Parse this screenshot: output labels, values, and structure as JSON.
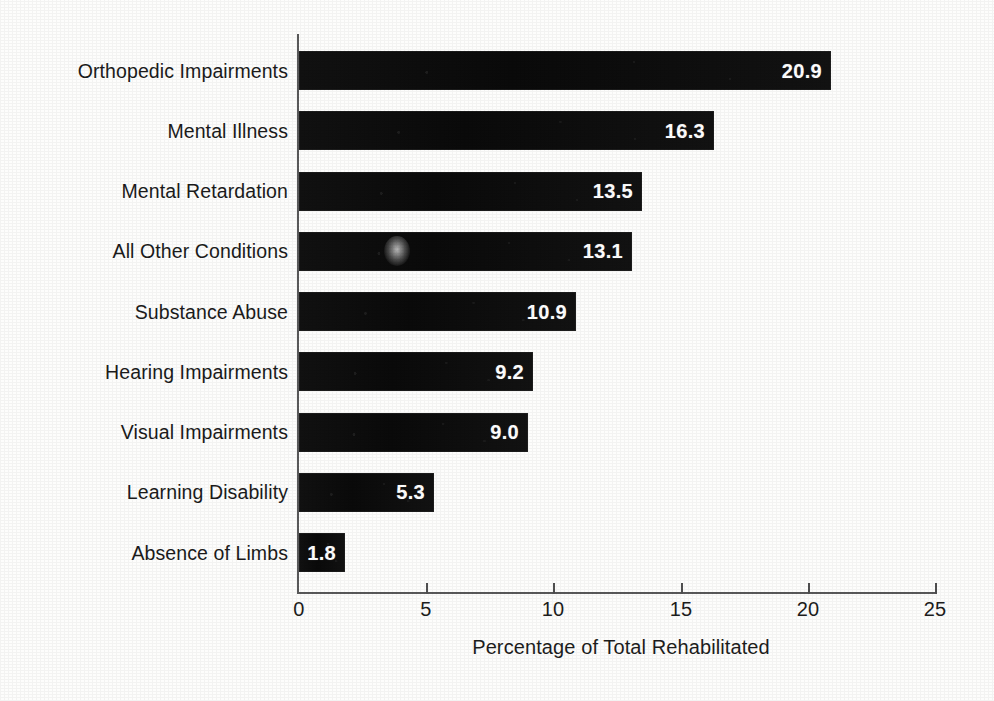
{
  "chart_data": {
    "type": "bar",
    "orientation": "horizontal",
    "title": "",
    "xlabel": "Percentage of Total Rehabilitated",
    "ylabel": "",
    "xlim": [
      0,
      25
    ],
    "xticks": [
      "0",
      "5",
      "10",
      "15",
      "20",
      "25"
    ],
    "grid": false,
    "legend": "none",
    "bar_color": "#0d0d0d",
    "value_label_color": "#ffffff",
    "categories": [
      "Orthopedic Impairments",
      "Mental Illness",
      "Mental Retardation",
      "All Other Conditions",
      "Substance Abuse",
      "Hearing Impairments",
      "Visual Impairments",
      "Learning Disability",
      "Absence of Limbs"
    ],
    "values": [
      20.9,
      16.3,
      13.5,
      13.1,
      10.9,
      9.2,
      9.0,
      5.3,
      1.8
    ],
    "value_labels": [
      "20.9",
      "16.3",
      "13.5",
      "13.1",
      "10.9",
      "9.2",
      "9.0",
      "5.3",
      "1.8"
    ]
  },
  "axis": {
    "x_title": "Percentage of Total Rehabilitated",
    "ticks": [
      {
        "label": "0",
        "value": 0
      },
      {
        "label": "5",
        "value": 5
      },
      {
        "label": "10",
        "value": 10
      },
      {
        "label": "15",
        "value": 15
      },
      {
        "label": "20",
        "value": 20
      },
      {
        "label": "25",
        "value": 25
      }
    ]
  }
}
